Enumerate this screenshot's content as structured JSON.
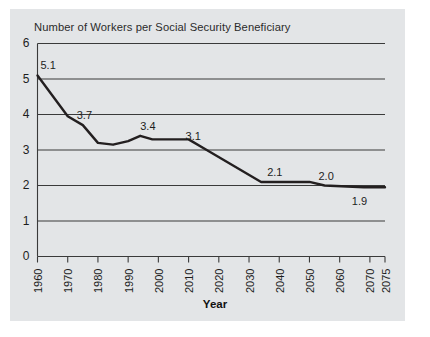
{
  "figure": {
    "panel_color": "#e3e5e7",
    "page_color": "#ffffff",
    "line_color": "#231f20",
    "grid_color": "#3a3a3a",
    "text_color": "#1d1d1d"
  },
  "chart_data": {
    "type": "line",
    "title": "Number of Workers per Social Security Beneficiary",
    "xlabel": "Year",
    "ylabel": "",
    "grid": true,
    "legend": "none",
    "xlim": [
      1960,
      2075
    ],
    "ylim": [
      0,
      6
    ],
    "ytick_labels": [
      "6",
      "5",
      "4",
      "3",
      "2",
      "1",
      "0"
    ],
    "yticks": [
      6,
      5,
      4,
      3,
      2,
      1,
      0
    ],
    "xtick_labels": [
      "1960",
      "1970",
      "1980",
      "1990",
      "2000",
      "2010",
      "2020",
      "2030",
      "2040",
      "2050",
      "2060",
      "2070",
      "2075"
    ],
    "xticks": [
      1960,
      1970,
      1980,
      1990,
      2000,
      2010,
      2020,
      2030,
      2040,
      2050,
      2060,
      2070,
      2075
    ],
    "series": [
      {
        "name": "Workers per beneficiary",
        "x": [
          1960,
          1970,
          1975,
          1980,
          1985,
          1990,
          1994,
          1998,
          2010,
          2016,
          2034,
          2050,
          2055,
          2068,
          2075
        ],
        "values": [
          5.1,
          3.95,
          3.7,
          3.2,
          3.15,
          3.25,
          3.4,
          3.3,
          3.3,
          3.0,
          2.1,
          2.1,
          2.0,
          1.95,
          1.95
        ]
      }
    ],
    "annotations": [
      {
        "text": "5.1",
        "x": 1960,
        "y": 5.1
      },
      {
        "text": "3.7",
        "x": 1972,
        "y": 3.7
      },
      {
        "text": "3.4",
        "x": 1993,
        "y": 3.4
      },
      {
        "text": "3.1",
        "x": 2008,
        "y": 3.1
      },
      {
        "text": "2.1",
        "x": 2035,
        "y": 2.1
      },
      {
        "text": "2.0",
        "x": 2052,
        "y": 2.0
      },
      {
        "text": "1.9",
        "x": 2066,
        "y": 1.9
      }
    ]
  }
}
